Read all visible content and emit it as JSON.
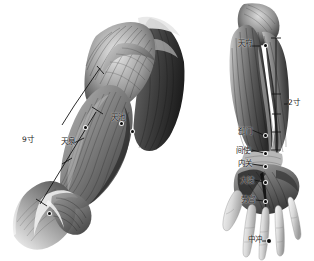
{
  "image": {
    "kind": "anatomical-illustration",
    "subject": "acupuncture meridian chart of the arm (Pericardium channel)",
    "background_color": "#ffffff",
    "ink_color": "#1a1a1a",
    "width": 314,
    "height": 261
  },
  "left_figure": {
    "name": "upper-arm-and-shoulder-anatomy",
    "measurement": {
      "label": "9寸",
      "description": "cun measurement bar along the medial upper arm"
    },
    "points": [
      {
        "id": "tianquan",
        "label": "天泉",
        "x": 86,
        "y": 137
      },
      {
        "id": "quze",
        "label": "",
        "x": 50,
        "y": 213
      },
      {
        "id": "tianchi",
        "label": "天池",
        "x": 122,
        "y": 123
      }
    ],
    "labels": [
      {
        "text": "9寸",
        "x": 22,
        "y": 140
      },
      {
        "text": "天泉",
        "x": 62,
        "y": 142
      },
      {
        "text": "天池",
        "x": 112,
        "y": 119
      }
    ]
  },
  "right_figure": {
    "name": "forearm-and-hand-anatomy",
    "measurement": {
      "label": "2寸",
      "description": "cun measurement bar along the distal forearm"
    },
    "points": [
      {
        "id": "ximen",
        "label": "郄门",
        "x": 264,
        "y": 136
      },
      {
        "id": "jianshi",
        "label": "间使",
        "x": 264,
        "y": 156
      },
      {
        "id": "neiguan",
        "label": "内关",
        "x": 264,
        "y": 168
      },
      {
        "id": "daling",
        "label": "大陵",
        "x": 266,
        "y": 185
      },
      {
        "id": "laogong",
        "label": "劳宫",
        "x": 265,
        "y": 204
      },
      {
        "id": "zhongchong",
        "label": "中冲",
        "x": 268,
        "y": 243
      },
      {
        "id": "tianfu",
        "label": "天府",
        "x": 258,
        "y": 48
      }
    ],
    "labels": [
      {
        "text": "天府",
        "x": 240,
        "y": 42
      },
      {
        "text": "2寸",
        "x": 288,
        "y": 103
      },
      {
        "text": "郄门",
        "x": 240,
        "y": 131
      },
      {
        "text": "间使",
        "x": 238,
        "y": 150
      },
      {
        "text": "内关",
        "x": 240,
        "y": 163
      },
      {
        "text": "大陵",
        "x": 242,
        "y": 180
      },
      {
        "text": "劳宫",
        "x": 243,
        "y": 199
      },
      {
        "text": "中冲",
        "x": 250,
        "y": 240
      }
    ]
  }
}
